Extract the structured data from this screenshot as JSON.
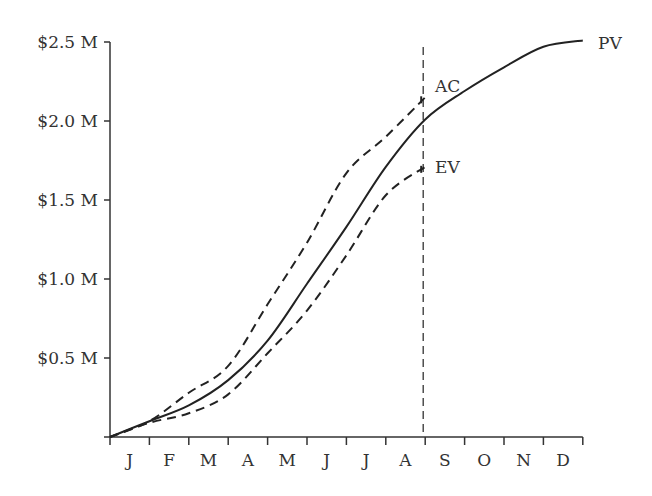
{
  "chart_data": {
    "type": "line",
    "title": "",
    "xlabel": "",
    "ylabel": "",
    "categories": [
      "J",
      "F",
      "M",
      "A",
      "M",
      "J",
      "J",
      "A",
      "S",
      "O",
      "N",
      "D"
    ],
    "y_ticks": [
      "$0.5 M",
      "$1.0 M",
      "$1.5 M",
      "$2.0 M",
      "$2.5 M"
    ],
    "y_tick_values": [
      0.5,
      1.0,
      1.5,
      2.0,
      2.5
    ],
    "ylim": [
      0,
      2.5
    ],
    "unit": "$M",
    "grid": false,
    "legend": "inline labels at line ends",
    "status_date_marker": {
      "after_month": "A",
      "style": "dashed vertical line"
    },
    "series": [
      {
        "name": "PV",
        "style": "solid",
        "x": [
          0,
          1,
          2,
          3,
          4,
          5,
          6,
          7,
          8,
          9,
          10,
          11,
          12
        ],
        "values": [
          0,
          0.1,
          0.2,
          0.36,
          0.61,
          0.97,
          1.33,
          1.71,
          2.01,
          2.19,
          2.34,
          2.47,
          2.51
        ]
      },
      {
        "name": "AC",
        "style": "dashed",
        "x": [
          0,
          1,
          2,
          3,
          4,
          5,
          6,
          7,
          8
        ],
        "values": [
          0,
          0.1,
          0.28,
          0.45,
          0.84,
          1.23,
          1.67,
          1.9,
          2.15
        ]
      },
      {
        "name": "EV",
        "style": "dashed",
        "x": [
          0,
          1,
          2,
          3,
          4,
          5,
          6,
          7,
          8
        ],
        "values": [
          0,
          0.09,
          0.15,
          0.27,
          0.53,
          0.8,
          1.15,
          1.53,
          1.71
        ]
      }
    ]
  },
  "labels": {
    "pv": "PV",
    "ac": "AC",
    "ev": "EV"
  },
  "colors": {
    "line": "#222222",
    "text": "#333333"
  }
}
